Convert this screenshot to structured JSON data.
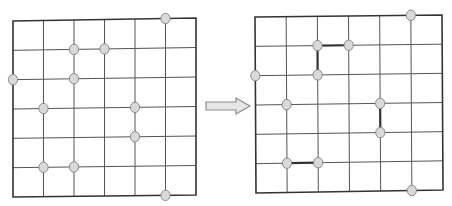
{
  "diagram": {
    "grid": {
      "cols": 6,
      "rows": 6
    },
    "colors": {
      "background": "#ffffff",
      "border": "#333333",
      "gridline": "#555555",
      "node_fill": "#d9d9d9",
      "node_stroke": "#8a8a8a",
      "edge": "#333333",
      "arrow_fill": "#e6e6e6",
      "arrow_stroke": "#8c8c8c"
    },
    "nodes": [
      {
        "col": 5,
        "row": 0
      },
      {
        "col": 2,
        "row": 1
      },
      {
        "col": 3,
        "row": 1
      },
      {
        "col": 0,
        "row": 2
      },
      {
        "col": 2,
        "row": 2
      },
      {
        "col": 1,
        "row": 3
      },
      {
        "col": 4,
        "row": 3
      },
      {
        "col": 4,
        "row": 4
      },
      {
        "col": 1,
        "row": 5
      },
      {
        "col": 2,
        "row": 5
      },
      {
        "col": 5,
        "row": 6
      }
    ],
    "left_panel": {
      "label": "before",
      "box": {
        "x0": 13,
        "y0": 21,
        "x1": 196,
        "y1": 197,
        "tl": [
          13,
          21
        ],
        "tr": [
          196,
          18
        ],
        "bl": [
          13,
          197
        ],
        "br": [
          196,
          195
        ]
      },
      "edges": []
    },
    "right_panel": {
      "label": "after",
      "box": {
        "tl": [
          255,
          17
        ],
        "tr": [
          442,
          15
        ],
        "bl": [
          256,
          193
        ],
        "br": [
          443,
          190
        ]
      },
      "edges": [
        {
          "from": [
            2,
            1
          ],
          "to": [
            3,
            1
          ]
        },
        {
          "from": [
            2,
            1
          ],
          "to": [
            2,
            2
          ]
        },
        {
          "from": [
            4,
            3
          ],
          "to": [
            4,
            4
          ]
        },
        {
          "from": [
            1,
            5
          ],
          "to": [
            2,
            5
          ]
        }
      ]
    },
    "arrow": {
      "label": "transforms-to",
      "x": 206,
      "y": 98,
      "width": 44,
      "height": 16
    }
  }
}
